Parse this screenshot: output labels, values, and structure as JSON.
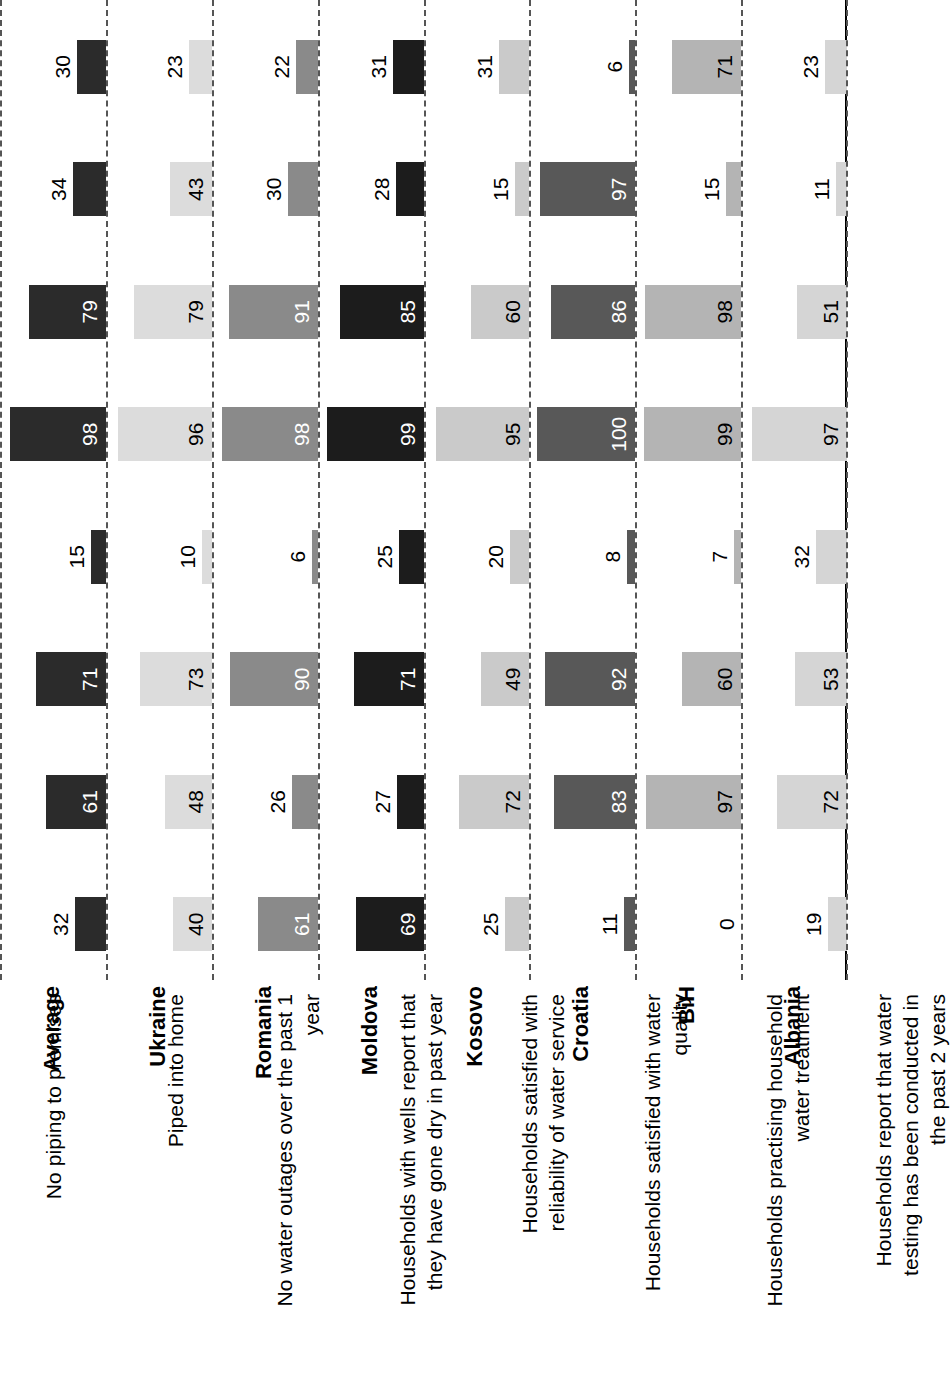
{
  "chart_data": {
    "type": "bar",
    "title": "",
    "subtitle": "",
    "xlabel": "",
    "ylabel": "",
    "ylim": [
      0,
      100
    ],
    "grid": "dashed category separators",
    "legend_position": "none",
    "orientation": "rotated 90 degrees counter-clockwise (grouped columns per country band)",
    "categories": [
      "No piping to premises",
      "Piped into home",
      "No water outages over the past 1 year",
      "Households with wells report that they have gone dry in past year",
      "Households satisfied with reliability of water service",
      "Households satisfied with water quality",
      "Households practising household water treatment",
      "Households report that water testing has been conducted in the past 2 years"
    ],
    "series": [
      {
        "name": "Albania",
        "color": "#d5d5d5",
        "label_color": "#000000",
        "values": [
          19,
          72,
          53,
          32,
          97,
          51,
          11,
          23
        ]
      },
      {
        "name": "BiH",
        "color": "#b4b4b4",
        "label_color": "#000000",
        "values": [
          0,
          97,
          60,
          7,
          99,
          98,
          15,
          71
        ]
      },
      {
        "name": "Croatia",
        "color": "#585858",
        "label_color": "#ffffff",
        "values": [
          11,
          83,
          92,
          8,
          100,
          86,
          97,
          6
        ]
      },
      {
        "name": "Kosovo",
        "color": "#cacaca",
        "label_color": "#000000",
        "values": [
          25,
          72,
          49,
          20,
          95,
          60,
          15,
          31
        ]
      },
      {
        "name": "Moldova",
        "color": "#1c1c1c",
        "label_color": "#ffffff",
        "values": [
          69,
          27,
          71,
          25,
          99,
          85,
          28,
          31
        ]
      },
      {
        "name": "Romania",
        "color": "#8a8a8a",
        "label_color": "#ffffff",
        "values": [
          61,
          26,
          90,
          6,
          98,
          91,
          30,
          22
        ]
      },
      {
        "name": "Ukraine",
        "color": "#dcdcdc",
        "label_color": "#000000",
        "values": [
          40,
          48,
          73,
          10,
          96,
          79,
          43,
          23
        ]
      },
      {
        "name": "Average",
        "color": "#2b2b2b",
        "label_color": "#ffffff",
        "values": [
          32,
          61,
          71,
          15,
          98,
          79,
          34,
          30
        ]
      }
    ]
  },
  "axis": {
    "country_labels": [
      "Albania",
      "BiH",
      "Croatia",
      "Kosovo",
      "Moldova",
      "Romania",
      "Ukraine",
      "Average"
    ],
    "indicator_labels": [
      "No piping to premises",
      "Piped into home",
      "No water outages over the past 1\nyear",
      "Households with wells report that\nthey have gone dry in past year",
      "Households satisfied with\nreliability of water service",
      "Households satisfied with water\nquality",
      "Households practising household\nwater treatment",
      "Households report that water\ntesting has been conducted in\nthe past 2 years"
    ]
  }
}
